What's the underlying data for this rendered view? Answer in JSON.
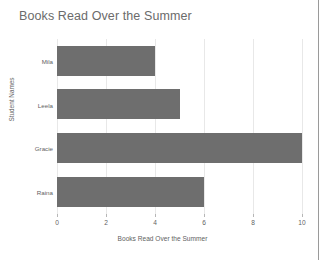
{
  "chart_data": {
    "type": "bar",
    "orientation": "horizontal",
    "title": "Books Read Over the Summer",
    "xlabel": "Books Read Over the Summer",
    "ylabel": "Student Names",
    "categories": [
      "Raina",
      "Gracie",
      "Leela",
      "Mila"
    ],
    "values": [
      6,
      10,
      5,
      4
    ],
    "xticks": [
      0,
      2,
      4,
      6,
      8,
      10
    ],
    "xtick_labels": [
      "0",
      "2",
      "4",
      "6",
      "8",
      "10"
    ],
    "xlim": [
      0,
      10
    ],
    "grid": "vertical",
    "legend": null,
    "bar_color": "#6e6e6e",
    "grid_color": "#e8e8e8",
    "axis_color": "#b6b6b6",
    "text_color": "#5f5f5f",
    "title_color": "#6b6b6b",
    "background": "#ffffff"
  }
}
